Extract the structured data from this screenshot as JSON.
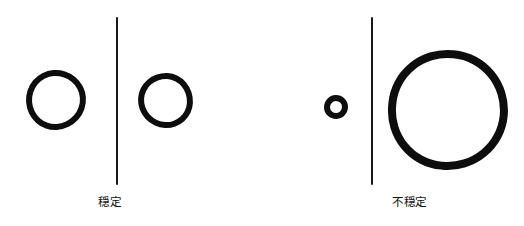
{
  "figure": {
    "width": 524,
    "height": 226,
    "background_color": "#ffffff",
    "ink_color": "#0d0d0d",
    "style": "hand-drawn line art"
  },
  "panels": [
    {
      "id": "stable",
      "caption": "穏定",
      "caption_meaning_hint": "stable",
      "caption_x": 98,
      "caption_y": 196,
      "divider": {
        "x": 116,
        "y_top": 17,
        "y_bottom": 185,
        "color": "#1a1a1a"
      },
      "circles": [
        {
          "name": "left-circle",
          "cx": 56,
          "cy": 100,
          "diameter": 60,
          "stroke_width": 6,
          "side": "left"
        },
        {
          "name": "right-circle",
          "cx": 165,
          "cy": 100,
          "diameter": 55,
          "stroke_width": 6,
          "side": "right"
        }
      ]
    },
    {
      "id": "unstable",
      "caption": "不穏定",
      "caption_meaning_hint": "unstable",
      "caption_x": 392,
      "caption_y": 196,
      "divider": {
        "x": 371,
        "y_top": 17,
        "y_bottom": 185,
        "color": "#1a1a1a"
      },
      "circles": [
        {
          "name": "small-circle",
          "cx": 336,
          "cy": 107,
          "diameter": 24,
          "stroke_width": 6,
          "side": "left"
        },
        {
          "name": "large-circle",
          "cx": 448,
          "cy": 110,
          "diameter": 120,
          "stroke_width": 8,
          "side": "right"
        }
      ]
    }
  ]
}
